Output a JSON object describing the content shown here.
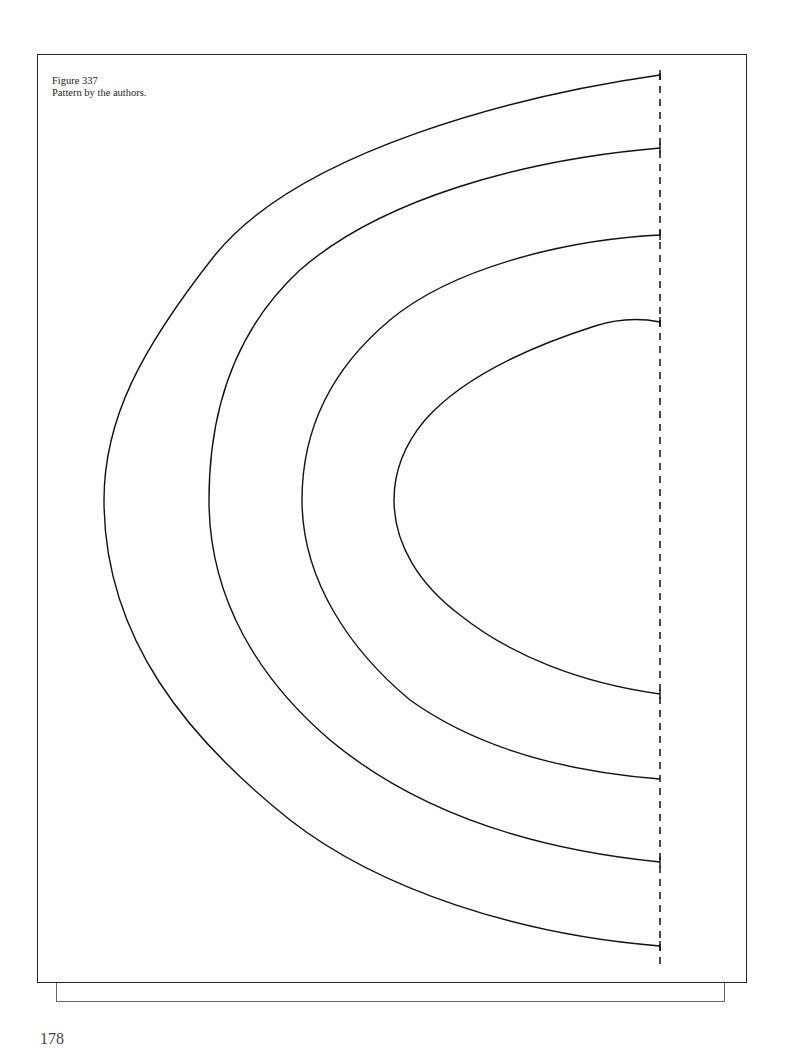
{
  "figure": {
    "number_label": "Figure 337",
    "caption": "Pattern by the authors.",
    "type": "sewing pattern — four nested half-oval curves with dashed fold line",
    "fold_line": {
      "style": "dashed",
      "x": 660,
      "y_start": 73,
      "y_end": 970
    },
    "curves": [
      {
        "name": "outer",
        "top_end": [
          660,
          75
        ],
        "leftmost": [
          104,
          500
        ],
        "bottom_end": [
          660,
          946
        ]
      },
      {
        "name": "second",
        "top_end": [
          660,
          148
        ],
        "leftmost": [
          209,
          500
        ],
        "bottom_end": [
          660,
          862
        ]
      },
      {
        "name": "third",
        "top_end": [
          660,
          235
        ],
        "leftmost": [
          302,
          500
        ],
        "bottom_end": [
          660,
          779
        ]
      },
      {
        "name": "inner",
        "top_end": [
          660,
          322
        ],
        "leftmost": [
          394,
          500
        ],
        "bottom_end": [
          660,
          694
        ]
      }
    ]
  },
  "page": {
    "number": "178"
  }
}
